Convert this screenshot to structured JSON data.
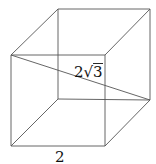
{
  "figure": {
    "shape": "cube",
    "edge_label": "2",
    "diagonal_label_coefficient": "2",
    "diagonal_label_radical_symbol": "√",
    "diagonal_label_radicand": "3",
    "diagonal_label": "2√3"
  }
}
